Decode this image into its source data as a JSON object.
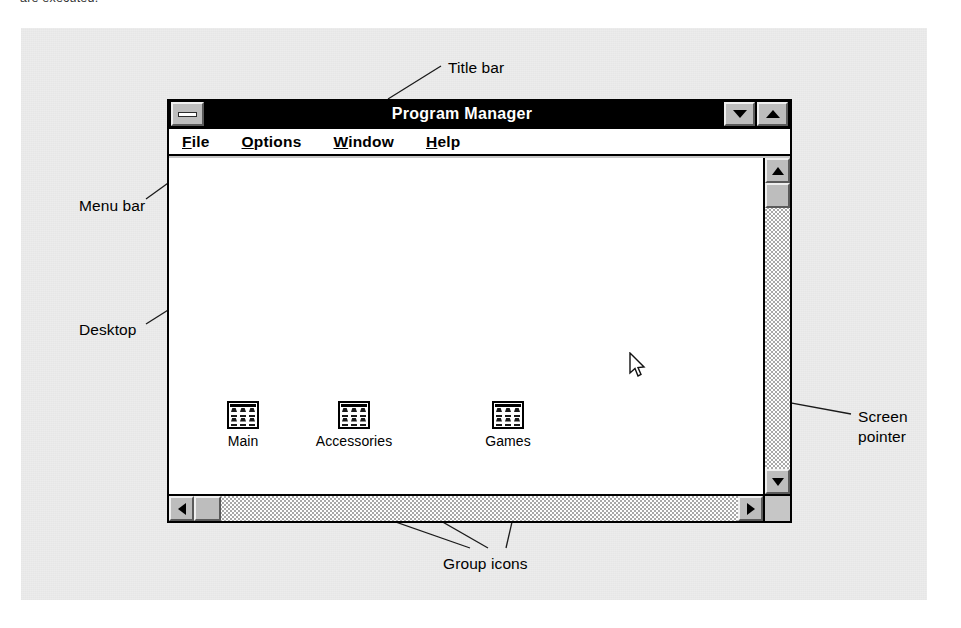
{
  "caption_cutoff": "are executed.",
  "window": {
    "title": "Program Manager",
    "control_box_icon": "minimize-bar-icon",
    "minimize_icon": "triangle-down-icon",
    "maximize_icon": "triangle-up-icon",
    "menu": [
      {
        "prefix": "",
        "accel": "F",
        "suffix": "ile"
      },
      {
        "prefix": "",
        "accel": "O",
        "suffix": "ptions"
      },
      {
        "prefix": "",
        "accel": "W",
        "suffix": "indow"
      },
      {
        "prefix": "",
        "accel": "H",
        "suffix": "elp"
      }
    ],
    "group_icons": [
      {
        "label": "Main",
        "icon": "program-group-icon"
      },
      {
        "label": "Accessories",
        "icon": "program-group-icon"
      },
      {
        "label": "Games",
        "icon": "program-group-icon"
      }
    ],
    "scrollbars": {
      "vertical": {
        "up_icon": "arrow-up-icon",
        "down_icon": "arrow-down-icon"
      },
      "horizontal": {
        "left_icon": "arrow-left-icon",
        "right_icon": "arrow-right-icon"
      }
    },
    "pointer_icon": "mouse-arrow-pointer-icon"
  },
  "annotations": {
    "title_bar": "Title bar",
    "menu_bar": "Menu bar",
    "desktop": "Desktop",
    "screen_pointer": "Screen\npointer",
    "group_icons": "Group icons"
  },
  "colors": {
    "panel_background": "#ececec",
    "window_face": "#c6c6c6",
    "title_bar": "#000000",
    "title_text": "#ffffff",
    "desktop": "#ffffff",
    "border": "#000000"
  }
}
